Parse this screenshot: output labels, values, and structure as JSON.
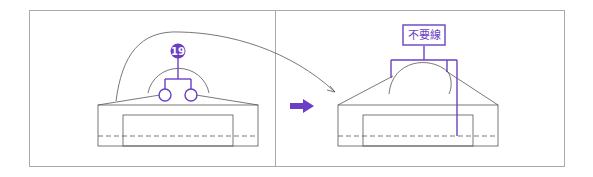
{
  "diagram": {
    "badge_number": "19",
    "label_box_text": "不要線",
    "colors": {
      "accent": "#6a3fc4",
      "line": "#555555",
      "frame": "#999999"
    }
  }
}
